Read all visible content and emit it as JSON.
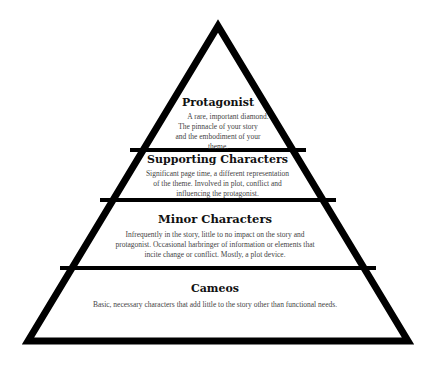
{
  "diagram": {
    "type": "pyramid",
    "colors": {
      "stroke": "#000000",
      "fill": "#ffffff",
      "title": "#111111",
      "text": "#444444"
    },
    "tiers": [
      {
        "title": "Protagonist",
        "lines": [
          "A rare, important diamond.",
          "The pinnacle of your story",
          "and the embodiment of your",
          "theme."
        ]
      },
      {
        "title": "Supporting Characters",
        "lines": [
          "Significant page time, a different representation",
          "of the theme. Involved in plot, conflict and",
          "influencing the protagonist."
        ]
      },
      {
        "title": "Minor Characters",
        "lines": [
          "Infrequently in the story, little to no impact on the story and",
          "protagonist. Occasional harbringer of information or elements that",
          "incite change or conflict. Mostly, a plot device."
        ]
      },
      {
        "title": "Cameos",
        "lines": [
          "Basic, necessary characters that add little to the story other than functional needs."
        ]
      }
    ]
  }
}
